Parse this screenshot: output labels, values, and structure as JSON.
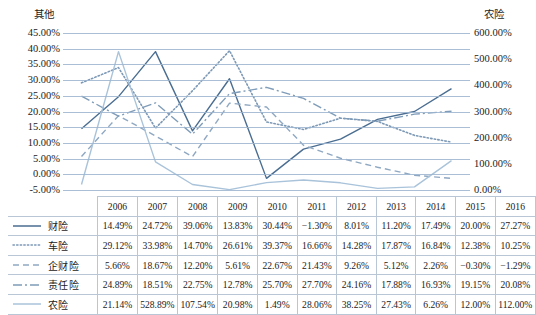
{
  "chart_data": {
    "type": "line",
    "title": "",
    "xlabel": "",
    "ylabel": "其他",
    "y2label": "农险",
    "grid": true,
    "legend_position": "table-left",
    "categories": [
      "2006",
      "2007",
      "2008",
      "2009",
      "2010",
      "2011",
      "2012",
      "2013",
      "2014",
      "2015",
      "2016"
    ],
    "ylim": [
      -5,
      45
    ],
    "yticks": [
      "-5.00%",
      "0.00%",
      "5.00%",
      "10.00%",
      "15.00%",
      "20.00%",
      "25.00%",
      "30.00%",
      "35.00%",
      "40.00%",
      "45.00%"
    ],
    "y2lim": [
      0,
      600
    ],
    "y2ticks": [
      "0.00%",
      "100.00%",
      "200.00%",
      "300.00%",
      "400.00%",
      "500.00%",
      "600.00%"
    ],
    "series": [
      {
        "name": "财险",
        "axis": "left",
        "style": "solid",
        "color": "#4a6d91",
        "values": [
          14.49,
          24.72,
          39.06,
          13.83,
          30.44,
          -1.3,
          8.01,
          11.2,
          17.49,
          20.0,
          27.27
        ],
        "labels": [
          "14.49%",
          "24.72%",
          "39.06%",
          "13.83%",
          "30.44%",
          "−1.30%",
          "8.01%",
          "11.20%",
          "17.49%",
          "20.00%",
          "27.27%"
        ]
      },
      {
        "name": "车险",
        "axis": "left",
        "style": "dotted",
        "color": "#7d99b6",
        "values": [
          29.12,
          33.98,
          14.7,
          26.61,
          39.37,
          16.66,
          14.28,
          17.87,
          16.84,
          12.38,
          10.25
        ],
        "labels": [
          "29.12%",
          "33.98%",
          "14.70%",
          "26.61%",
          "39.37%",
          "16.66%",
          "14.28%",
          "17.87%",
          "16.84%",
          "12.38%",
          "10.25%"
        ]
      },
      {
        "name": "企财险",
        "axis": "left",
        "style": "dashed",
        "color": "#8fa8c2",
        "values": [
          5.66,
          18.67,
          12.2,
          5.61,
          22.67,
          21.43,
          9.26,
          5.12,
          2.26,
          -0.3,
          -1.29
        ],
        "labels": [
          "5.66%",
          "18.67%",
          "12.20%",
          "5.61%",
          "22.67%",
          "21.43%",
          "9.26%",
          "5.12%",
          "2.26%",
          "−0.30%",
          "−1.29%"
        ]
      },
      {
        "name": "责任险",
        "axis": "left",
        "style": "dashdot",
        "color": "#7f9cb8",
        "values": [
          24.89,
          18.51,
          22.75,
          12.78,
          25.7,
          27.7,
          24.16,
          17.88,
          16.93,
          19.15,
          20.08
        ],
        "labels": [
          "24.89%",
          "18.51%",
          "22.75%",
          "12.78%",
          "25.70%",
          "27.70%",
          "24.16%",
          "17.88%",
          "16.93%",
          "19.15%",
          "20.08%"
        ]
      },
      {
        "name": "农险",
        "axis": "right",
        "style": "solid",
        "color": "#a9c3da",
        "values": [
          21.14,
          528.89,
          107.54,
          20.98,
          1.49,
          28.06,
          38.25,
          27.43,
          6.26,
          12.0,
          112.0
        ],
        "labels": [
          "21.14%",
          "528.89%",
          "107.54%",
          "20.98%",
          "1.49%",
          "28.06%",
          "38.25%",
          "27.43%",
          "6.26%",
          "12.00%",
          "112.00%"
        ]
      }
    ]
  },
  "table": {
    "corner": "",
    "headers": [
      "2006",
      "2007",
      "2008",
      "2009",
      "2010",
      "2011",
      "2012",
      "2013",
      "2014",
      "2015",
      "2016"
    ]
  }
}
